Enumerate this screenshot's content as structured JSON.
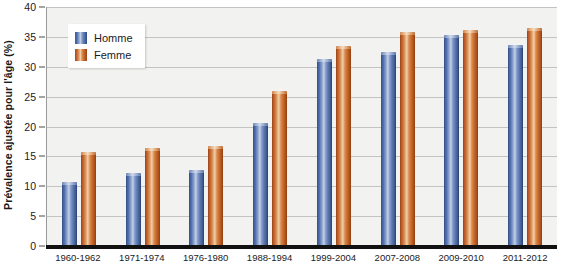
{
  "chart_data": {
    "type": "bar",
    "title": "",
    "xlabel": "",
    "ylabel": "Prévalence ajustée pour l'âge (%)",
    "ylim": [
      0,
      40
    ],
    "yticks": [
      0,
      5,
      10,
      15,
      20,
      25,
      30,
      35,
      40
    ],
    "ytick_labels": [
      "0",
      "5",
      "10",
      "15",
      "20",
      "25",
      "30",
      "35",
      "40"
    ],
    "grid": true,
    "legend_position": "top-left",
    "categories": [
      "1960-1962",
      "1971-1974",
      "1976-1980",
      "1988-1994",
      "1999-2004",
      "2007-2008",
      "2009-2010",
      "2011-2012"
    ],
    "series": [
      {
        "name": "Homme",
        "color": "#4a6aa8",
        "values": [
          10.7,
          12.2,
          12.8,
          20.6,
          31.3,
          32.4,
          35.4,
          33.7
        ]
      },
      {
        "name": "Femme",
        "color": "#c2602a",
        "values": [
          15.7,
          16.4,
          16.8,
          26.0,
          33.4,
          35.8,
          36.1,
          36.5
        ]
      }
    ]
  },
  "legend": {
    "items": [
      {
        "label": "Homme",
        "swatch": "homme-swatch-icon"
      },
      {
        "label": "Femme",
        "swatch": "femme-swatch-icon"
      }
    ]
  },
  "colors": {
    "homme": "#4a6aa8",
    "femme": "#c2602a",
    "plot_background": "#f2f2f0",
    "gridline": "#c3c3c1",
    "axis": "#111111",
    "text": "#1a1a1a"
  }
}
